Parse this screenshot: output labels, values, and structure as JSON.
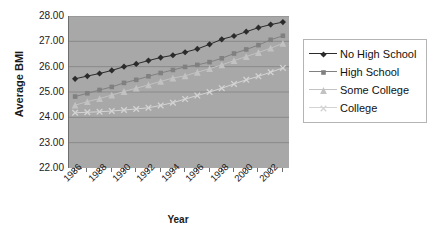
{
  "chart_data": {
    "type": "line",
    "title": "",
    "xlabel": "Year",
    "ylabel": "Average BMI",
    "grid": true,
    "legend_position": "right",
    "xlim": [
      1986,
      2003
    ],
    "ylim": [
      22.0,
      28.0
    ],
    "y_ticks": [
      "28.00",
      "27.00",
      "26.00",
      "25.00",
      "24.00",
      "23.00",
      "22.00"
    ],
    "y_tick_values": [
      28.0,
      27.0,
      26.0,
      25.0,
      24.0,
      23.0,
      22.0
    ],
    "x_tick_labels": [
      "1986",
      "1988",
      "1990",
      "1992",
      "1994",
      "1996",
      "1998",
      "2000",
      "2002"
    ],
    "x": [
      1986,
      1987,
      1988,
      1989,
      1990,
      1991,
      1992,
      1993,
      1994,
      1995,
      1996,
      1997,
      1998,
      1999,
      2000,
      2001,
      2002,
      2003
    ],
    "series": [
      {
        "name": "No High School",
        "marker": "diamond",
        "color": "#2b2b2b",
        "values": [
          25.52,
          25.63,
          25.73,
          25.85,
          26.0,
          26.11,
          26.24,
          26.36,
          26.45,
          26.57,
          26.7,
          26.88,
          27.08,
          27.21,
          27.38,
          27.54,
          27.66,
          27.76
        ]
      },
      {
        "name": "High School",
        "marker": "square",
        "color": "#808080",
        "values": [
          24.82,
          24.95,
          25.08,
          25.2,
          25.36,
          25.48,
          25.62,
          25.75,
          25.87,
          25.99,
          26.07,
          26.18,
          26.33,
          26.52,
          26.68,
          26.85,
          27.06,
          27.22
        ]
      },
      {
        "name": "Some College",
        "marker": "triangle",
        "color": "#c2c2c2",
        "values": [
          24.48,
          24.62,
          24.74,
          24.88,
          25.02,
          25.15,
          25.28,
          25.42,
          25.55,
          25.64,
          25.78,
          25.92,
          26.07,
          26.24,
          26.4,
          26.56,
          26.73,
          26.92
        ]
      },
      {
        "name": "College",
        "marker": "x",
        "color": "#d4d4d4",
        "values": [
          24.18,
          24.2,
          24.22,
          24.25,
          24.29,
          24.33,
          24.38,
          24.47,
          24.58,
          24.72,
          24.86,
          25.0,
          25.15,
          25.32,
          25.48,
          25.62,
          25.78,
          25.95
        ]
      }
    ]
  },
  "legend": {
    "items": [
      {
        "label": "No High School"
      },
      {
        "label": "High School"
      },
      {
        "label": "Some College"
      },
      {
        "label": "College"
      }
    ]
  },
  "axes": {
    "y_title": "Average BMI",
    "x_title": "Year"
  },
  "colors": {
    "plot_background": "#a8a8a8",
    "gridline": "#8a8a8a",
    "axis_line": "#6e6e6e",
    "text": "#1a1a1a",
    "legend_border": "#b4b4b4"
  }
}
